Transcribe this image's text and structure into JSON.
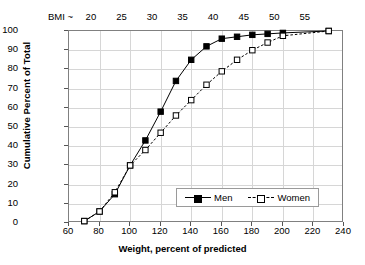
{
  "chart_data": {
    "type": "line",
    "title": "",
    "xlabel": "Weight, percent of predicted",
    "ylabel": "Cumulative Percent of Total",
    "xlim": [
      60,
      240
    ],
    "ylim": [
      0,
      100
    ],
    "xticks": [
      60,
      80,
      100,
      120,
      140,
      160,
      180,
      200,
      220,
      240
    ],
    "yticks": [
      0,
      10,
      20,
      30,
      40,
      50,
      60,
      70,
      80,
      90,
      100
    ],
    "grid": true,
    "legend_position": "lower right",
    "secondary_axis": {
      "caption": "BMI ~",
      "position": "top",
      "ticks": [
        20,
        25,
        30,
        35,
        40,
        45,
        50,
        55
      ],
      "tick_weights": [
        75,
        95,
        115,
        135,
        155,
        175,
        195,
        215
      ]
    },
    "series": [
      {
        "name": "Men",
        "marker": "filled-square",
        "line": "solid",
        "color": "#000000",
        "x": [
          70,
          80,
          90,
          100,
          110,
          120,
          130,
          140,
          150,
          160,
          170,
          180,
          190,
          200,
          230
        ],
        "y": [
          1,
          6,
          15,
          30,
          43,
          58,
          74,
          85,
          92,
          96,
          97,
          98,
          98.5,
          99,
          100
        ]
      },
      {
        "name": "Women",
        "marker": "open-square",
        "line": "dashed",
        "color": "#000000",
        "x": [
          70,
          80,
          90,
          100,
          110,
          120,
          130,
          140,
          150,
          160,
          170,
          180,
          190,
          200,
          230
        ],
        "y": [
          1,
          6,
          16,
          30,
          38,
          47,
          56,
          64,
          72,
          79,
          85,
          90,
          94,
          97.5,
          100
        ]
      }
    ]
  },
  "legend": {
    "items": [
      {
        "label": "Men"
      },
      {
        "label": "Women"
      }
    ]
  }
}
